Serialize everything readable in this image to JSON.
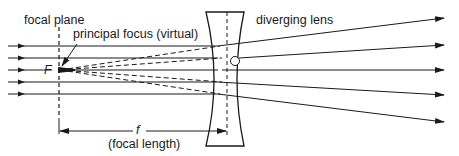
{
  "diagram": {
    "labels": {
      "focal_plane": "focal plane",
      "principal_focus": "principal focus (virtual)",
      "diverging_lens": "diverging lens",
      "focus_symbol": "F",
      "focal_length_symbol": "f",
      "focal_length": "(focal length)"
    },
    "colors": {
      "line": "#1a1a1a",
      "background": "#ffffff"
    },
    "incoming_rays_count": 5,
    "outgoing_rays_count": 5
  }
}
